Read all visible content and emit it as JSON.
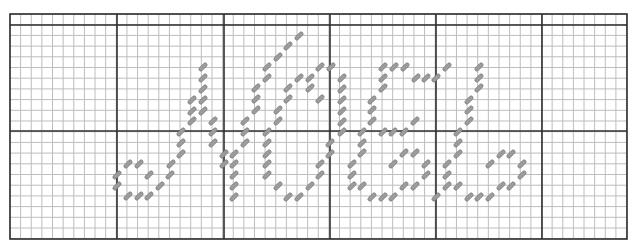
{
  "pattern": {
    "title": "Cross-stitch chart: Noel",
    "word": "Noel",
    "grid": {
      "left": 10,
      "top": 14,
      "right": 627,
      "bottom": 239,
      "cell": 10.63,
      "row_height": 10.7,
      "major_every": 10,
      "major_x": [
        117,
        224,
        330,
        436,
        542
      ],
      "major_y": [
        25,
        131
      ],
      "minor_color": "#bdbdbd",
      "major_color": "#2e2e2e",
      "border_color": "#2e2e2e"
    },
    "stitch_style": {
      "fill": "#9c9c9c",
      "stroke": "#6f6f6f",
      "length": 10,
      "width": 4,
      "angle": -45
    },
    "letters": [
      {
        "name": "J",
        "stitches": [
          [
            203,
            67
          ],
          [
            203,
            78
          ],
          [
            203,
            89
          ],
          [
            203,
            100
          ],
          [
            203,
            111
          ],
          [
            192,
            100
          ],
          [
            192,
            111
          ],
          [
            192,
            121
          ],
          [
            181,
            132
          ],
          [
            181,
            143
          ],
          [
            181,
            154
          ],
          [
            171,
            164
          ],
          [
            170,
            175
          ],
          [
            160,
            186
          ],
          [
            149,
            196
          ],
          [
            139,
            196
          ],
          [
            128,
            196
          ],
          [
            117,
            186
          ],
          [
            117,
            175
          ],
          [
            128,
            164
          ],
          [
            139,
            164
          ],
          [
            149,
            175
          ]
        ]
      },
      {
        "name": "N",
        "stitches": [
          [
            213,
            121
          ],
          [
            213,
            132
          ],
          [
            213,
            143
          ],
          [
            224,
            154
          ],
          [
            224,
            164
          ],
          [
            234,
            154
          ],
          [
            234,
            164
          ],
          [
            234,
            175
          ],
          [
            234,
            186
          ],
          [
            234,
            197
          ],
          [
            245,
            121
          ],
          [
            245,
            132
          ],
          [
            245,
            143
          ],
          [
            256,
            110
          ],
          [
            256,
            99
          ],
          [
            256,
            88
          ],
          [
            267,
            78
          ],
          [
            267,
            67
          ],
          [
            278,
            57
          ],
          [
            288,
            46
          ],
          [
            299,
            36
          ],
          [
            278,
            110
          ],
          [
            278,
            121
          ],
          [
            267,
            132
          ],
          [
            267,
            143
          ],
          [
            267,
            154
          ],
          [
            267,
            164
          ],
          [
            267,
            175
          ],
          [
            278,
            186
          ],
          [
            288,
            197
          ],
          [
            299,
            197
          ],
          [
            310,
            186
          ],
          [
            320,
            175
          ],
          [
            320,
            164
          ],
          [
            330,
            154
          ],
          [
            330,
            143
          ]
        ]
      },
      {
        "name": "O",
        "stitches": [
          [
            288,
            88
          ],
          [
            288,
            99
          ],
          [
            299,
            78
          ],
          [
            310,
            78
          ],
          [
            310,
            88
          ],
          [
            320,
            99
          ],
          [
            320,
            67
          ],
          [
            331,
            67
          ],
          [
            342,
            78
          ],
          [
            342,
            89
          ],
          [
            342,
            100
          ],
          [
            342,
            111
          ],
          [
            342,
            122
          ],
          [
            342,
            132
          ]
        ]
      },
      {
        "name": "E",
        "stitches": [
          [
            383,
            67
          ],
          [
            394,
            67
          ],
          [
            405,
            67
          ],
          [
            383,
            78
          ],
          [
            383,
            88
          ],
          [
            372,
            100
          ],
          [
            372,
            110
          ],
          [
            372,
            121
          ],
          [
            362,
            132
          ],
          [
            362,
            143
          ],
          [
            362,
            153
          ],
          [
            352,
            164
          ],
          [
            352,
            175
          ],
          [
            352,
            186
          ],
          [
            362,
            186
          ],
          [
            372,
            197
          ],
          [
            383,
            197
          ],
          [
            393,
            197
          ],
          [
            383,
            132
          ],
          [
            393,
            132
          ],
          [
            404,
            132
          ],
          [
            415,
            121
          ],
          [
            404,
            153
          ],
          [
            415,
            153
          ],
          [
            393,
            164
          ],
          [
            404,
            186
          ],
          [
            415,
            186
          ],
          [
            426,
            175
          ],
          [
            426,
            164
          ],
          [
            416,
            78
          ],
          [
            426,
            78
          ],
          [
            436,
            78
          ]
        ]
      },
      {
        "name": "L",
        "stitches": [
          [
            447,
            67
          ],
          [
            479,
            67
          ],
          [
            479,
            78
          ],
          [
            479,
            88
          ],
          [
            469,
            100
          ],
          [
            469,
            110
          ],
          [
            469,
            121
          ],
          [
            458,
            132
          ],
          [
            458,
            143
          ],
          [
            458,
            154
          ],
          [
            447,
            164
          ],
          [
            447,
            175
          ],
          [
            447,
            186
          ],
          [
            458,
            186
          ],
          [
            436,
            197
          ],
          [
            469,
            197
          ],
          [
            479,
            197
          ],
          [
            490,
            197
          ],
          [
            501,
            186
          ],
          [
            511,
            186
          ],
          [
            522,
            175
          ],
          [
            522,
            164
          ],
          [
            511,
            154
          ],
          [
            501,
            154
          ],
          [
            490,
            164
          ]
        ]
      }
    ]
  }
}
